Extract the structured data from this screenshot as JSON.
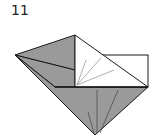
{
  "diagram": {
    "step_number": "11",
    "colors": {
      "paper_color": "#9a9a9a",
      "paper_white": "#ffffff",
      "line": "#1a1a1a",
      "inner_line": "#555555"
    }
  }
}
